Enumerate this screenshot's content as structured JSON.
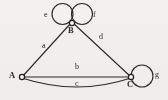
{
  "diagram": {
    "kind": "multigraph",
    "background_color": "#f2f1ef",
    "stroke_color": "#2b2b2b",
    "node_fill_color": "#f7f6f4",
    "vertices": [
      {
        "id": "A",
        "label": "A",
        "cx": 22,
        "cy": 77,
        "r": 2.6,
        "label_x": 10,
        "label_y": 72
      },
      {
        "id": "B",
        "label": "B",
        "cx": 72,
        "cy": 23,
        "r": 2.6,
        "label_x": 68,
        "label_y": 27
      },
      {
        "id": "C",
        "label": "C",
        "cx": 131,
        "cy": 77,
        "r": 2.6,
        "label_x": 127,
        "label_y": 81
      }
    ],
    "edges": [
      {
        "id": "a",
        "label": "a",
        "from": "A",
        "to": "B",
        "shape": "straight",
        "label_x": 42,
        "label_y": 42
      },
      {
        "id": "b",
        "label": "b",
        "from": "A",
        "to": "C",
        "shape": "straight",
        "label_x": 76,
        "label_y": 64
      },
      {
        "id": "c",
        "label": "c",
        "from": "A",
        "to": "C",
        "shape": "curve-below",
        "label_x": 76,
        "label_y": 80
      },
      {
        "id": "d",
        "label": "d",
        "from": "B",
        "to": "C",
        "shape": "straight",
        "label_x": 99,
        "label_y": 33
      }
    ],
    "loops": [
      {
        "id": "e",
        "label": "e",
        "at": "B",
        "side": "left",
        "cx": 62.5,
        "cy": 14,
        "r": 10.5,
        "label_x": 44,
        "label_y": 12
      },
      {
        "id": "f",
        "label": "f",
        "at": "B",
        "side": "right",
        "cx": 82,
        "cy": 14,
        "r": 10.5,
        "label_x": 93,
        "label_y": 12
      },
      {
        "id": "g",
        "label": "g",
        "at": "C",
        "side": "right",
        "cx": 142,
        "cy": 76,
        "r": 11,
        "label_x": 155,
        "label_y": 72
      }
    ]
  }
}
